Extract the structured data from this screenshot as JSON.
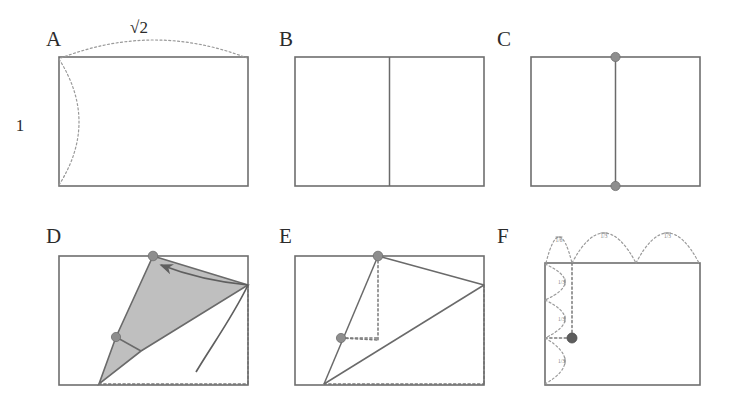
{
  "figure": {
    "width": 729,
    "height": 409,
    "background": "#ffffff",
    "stroke_color": "#6e6e6e",
    "shade_color": "#b4b4b4",
    "dot_color": "#8e8e8e",
    "dot_dark_color": "#5d5d5d",
    "guide_color": "#7a7a7a"
  },
  "panels": [
    {
      "id": "A",
      "label": "A",
      "label_pos": [
        46,
        46
      ],
      "rect": [
        59,
        57,
        189,
        129
      ],
      "caption": "Silver rectangle with side ratio 1 to root two",
      "dimensions": [
        {
          "name": "top-dimension",
          "text": "√2",
          "pos": [
            139,
            33
          ]
        },
        {
          "name": "left-dimension",
          "text": "1",
          "pos": [
            20,
            131
          ]
        }
      ],
      "braces": [
        {
          "name": "top-brace",
          "from": [
            61,
            58
          ],
          "to": [
            247,
            58
          ],
          "bulge": -18
        },
        {
          "name": "left-brace",
          "from": [
            59,
            59
          ],
          "to": [
            59,
            185
          ],
          "bulge": -20
        }
      ],
      "dots": [],
      "creases": []
    },
    {
      "id": "B",
      "label": "B",
      "label_pos": [
        279,
        46
      ],
      "rect": [
        295,
        57,
        189,
        129
      ],
      "caption": "Rectangle folded in half, vertical centre crease",
      "dimensions": [],
      "braces": [],
      "dots": [],
      "creases": [
        {
          "name": "centre-crease",
          "kind": "solid",
          "points": [
            [
              389.5,
              57
            ],
            [
              389.5,
              186
            ]
          ]
        }
      ]
    },
    {
      "id": "C",
      "label": "C",
      "label_pos": [
        497,
        46
      ],
      "rect": [
        531,
        57,
        169,
        129
      ],
      "caption": "Midpoints of top and bottom edges marked",
      "dimensions": [],
      "braces": [],
      "dots": [
        {
          "name": "top-midpoint-dot",
          "pos": [
            615.5,
            57
          ],
          "r": 4.6,
          "tone": "light"
        },
        {
          "name": "bottom-midpoint-dot",
          "pos": [
            615.5,
            186
          ],
          "r": 4.6,
          "tone": "light"
        }
      ],
      "creases": [
        {
          "name": "centre-crease",
          "kind": "solid",
          "points": [
            [
              615.5,
              57
            ],
            [
              615.5,
              186
            ]
          ]
        }
      ]
    },
    {
      "id": "D",
      "label": "D",
      "label_pos": [
        46,
        243
      ],
      "rect": [
        59,
        256,
        189,
        129
      ],
      "caption": "Bottom right corner folded up onto the top midpoint",
      "dimensions": [],
      "braces": [],
      "dots": [
        {
          "name": "top-midpoint-dot",
          "pos": [
            153,
            256
          ],
          "r": 4.8,
          "tone": "light"
        },
        {
          "name": "edge-midpoint-dot",
          "pos": [
            116,
            337
          ],
          "r": 4.6,
          "tone": "light"
        }
      ],
      "creases": [
        {
          "name": "crease-short-tick",
          "kind": "solid",
          "points": [
            [
              116,
              337
            ],
            [
              141,
              351
            ]
          ]
        }
      ],
      "shaded_polygon": {
        "name": "folded-flap",
        "points": [
          [
            153,
            256
          ],
          [
            248,
            285
          ],
          [
            141,
            351
          ],
          [
            99,
            384
          ],
          [
            116,
            337
          ]
        ]
      },
      "fold_arrow": {
        "name": "fold-direction-arrow",
        "path": "M 248 285 C 232 318, 212 345, 196 372",
        "arrow_path": "M 248 285 C 217 282, 187 275, 161 265",
        "tip": [
          161,
          265
        ],
        "tip_angle": -160
      },
      "dashed_guides": [
        {
          "name": "bottom-guide",
          "points": [
            [
              99,
              384
            ],
            [
              248,
              384
            ]
          ]
        },
        {
          "name": "right-guide",
          "points": [
            [
              248,
              285
            ],
            [
              248,
              384
            ]
          ]
        }
      ]
    },
    {
      "id": "E",
      "label": "E",
      "label_pos": [
        279,
        243
      ],
      "rect": [
        295,
        256,
        189,
        129
      ],
      "caption": "Unfolded sheet showing the crease lines and the located point",
      "dimensions": [],
      "braces": [],
      "dots": [
        {
          "name": "top-midpoint-dot",
          "pos": [
            378,
            256
          ],
          "r": 4.8,
          "tone": "light"
        },
        {
          "name": "division-point-dot",
          "pos": [
            341,
            338
          ],
          "r": 4.6,
          "tone": "light"
        }
      ],
      "creases": [
        {
          "name": "crease-left",
          "kind": "solid",
          "points": [
            [
              378,
              256
            ],
            [
              324,
              384
            ]
          ]
        },
        {
          "name": "crease-right-upper",
          "kind": "solid",
          "points": [
            [
              378,
              256
            ],
            [
              484,
              285
            ]
          ]
        },
        {
          "name": "crease-right-lower",
          "kind": "solid",
          "points": [
            [
              324,
              384
            ],
            [
              484,
              285
            ]
          ]
        }
      ],
      "dashed_guides": [
        {
          "name": "vertical-drop",
          "points": [
            [
              378,
              256
            ],
            [
              378,
              340
            ]
          ]
        },
        {
          "name": "horizontal-to-point",
          "points": [
            [
              341,
              338
            ],
            [
              378,
              338
            ]
          ]
        },
        {
          "name": "diagonal-to-point",
          "points": [
            [
              341,
              338
            ],
            [
              378,
              340
            ]
          ]
        },
        {
          "name": "bottom-guide",
          "points": [
            [
              324,
              384
            ],
            [
              484,
              384
            ]
          ]
        },
        {
          "name": "right-guide",
          "points": [
            [
              484,
              285
            ],
            [
              484,
              384
            ]
          ]
        }
      ]
    },
    {
      "id": "F",
      "label": "F",
      "label_pos": [
        497,
        243
      ],
      "rect": [
        545,
        263,
        155,
        122
      ],
      "caption": "The located point divides the sides into thirds",
      "dimensions": [],
      "braces": [
        {
          "name": "top-brace-1",
          "from": [
            546,
            263
          ],
          "to": [
            572,
            263
          ],
          "bulge": -26,
          "tick": "1/6"
        },
        {
          "name": "top-brace-2",
          "from": [
            572,
            263
          ],
          "to": [
            636,
            263
          ],
          "bulge": -30,
          "tick": "1/3"
        },
        {
          "name": "top-brace-3",
          "from": [
            636,
            263
          ],
          "to": [
            699,
            263
          ],
          "bulge": -30,
          "tick": "1/3"
        },
        {
          "name": "left-brace-1",
          "from": [
            545,
            264
          ],
          "to": [
            545,
            300
          ],
          "bulge": -20,
          "tick": "1/3"
        },
        {
          "name": "left-brace-2",
          "from": [
            545,
            300
          ],
          "to": [
            545,
            338
          ],
          "bulge": -20,
          "tick": "1/3"
        },
        {
          "name": "left-brace-3",
          "from": [
            545,
            338
          ],
          "to": [
            545,
            384
          ],
          "bulge": -20,
          "tick": "1/3"
        }
      ],
      "dots": [
        {
          "name": "division-point-dot",
          "pos": [
            572,
            338
          ],
          "r": 5.0,
          "tone": "dark"
        }
      ],
      "creases": [],
      "dashed_guides": [
        {
          "name": "vertical-guide",
          "points": [
            [
              572,
              263
            ],
            [
              572,
              338
            ]
          ]
        },
        {
          "name": "horizontal-guide",
          "points": [
            [
              545,
              338
            ],
            [
              572,
              338
            ]
          ]
        }
      ]
    }
  ]
}
